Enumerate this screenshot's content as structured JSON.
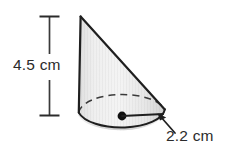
{
  "figure": {
    "type": "geometry-diagram",
    "shape": "oblique-cone",
    "background_color": "#ffffff",
    "outline_color": "#2b2b2b",
    "fill_color": "#e9e9e9",
    "labels": {
      "height": "4.5 cm",
      "radius": "2.2 cm"
    },
    "measurements": [
      {
        "name": "height",
        "value": 4.5,
        "unit": "cm",
        "text": "4.5 cm"
      },
      {
        "name": "radius",
        "value": 2.2,
        "unit": "cm",
        "text": "2.2 cm"
      }
    ],
    "annotations": {
      "height_dimension_line": "vertical line with serif end caps",
      "radius_line": "horizontal segment from center dot to right edge of base ellipse",
      "center_dot": "filled black dot at base center",
      "hidden_arc": "dashed back half of base ellipse",
      "leader_arrow": "arrow from 2.2 cm label to end of radius line"
    }
  }
}
